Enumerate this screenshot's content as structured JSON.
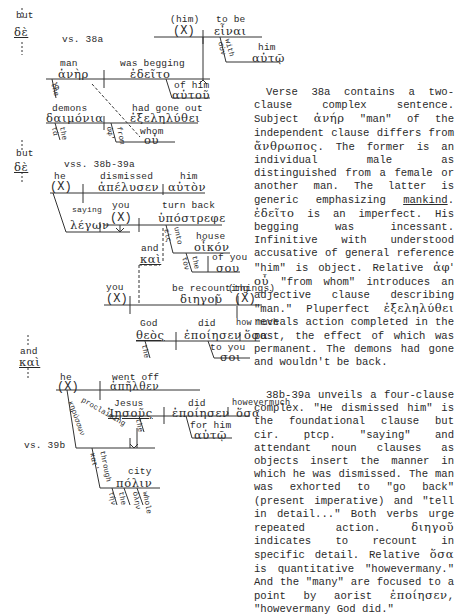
{
  "diagram": {
    "connectors": {
      "but_1": {
        "en": "but",
        "gk": "δὲ"
      },
      "but_2": {
        "en": "but",
        "gk": "δὲ"
      },
      "and_1": {
        "en": "and",
        "gk": "καὶ"
      }
    },
    "verse_labels": {
      "v38a": "vs. 38a",
      "v38b39a": "vss. 38b-39a",
      "v39b": "vs. 39b"
    },
    "clause_38a": {
      "subject": {
        "en": "man",
        "gk": "ἀνὴρ"
      },
      "verb": {
        "en": "was begging",
        "gk": "ἐδεῖτο"
      },
      "article": "the",
      "article_gk": "ὁ",
      "genitive": {
        "en": "of him",
        "gk": "αὐτοῦ"
      },
      "inf_subject": {
        "en": "(him)",
        "gk": "(X)"
      },
      "infinitive": {
        "en": "to be",
        "gk": "εἶναι"
      },
      "with": {
        "en": "with",
        "gk": "σὺν"
      },
      "with_obj": {
        "en": "him",
        "gk": "αὐτῷ"
      },
      "rel_subject": {
        "en": "demons",
        "gk": "δαιμόνια"
      },
      "rel_article": {
        "en": "the",
        "gk": "τὰ"
      },
      "rel_verb": {
        "en": "had gone out",
        "gk": "ἐξεληλύθει"
      },
      "rel_prep": {
        "en": "from",
        "gk": "ἀφ'"
      },
      "rel_obj": {
        "en": "whom",
        "gk": "οὗ"
      }
    },
    "clause_38b39a": {
      "subject": {
        "en": "he",
        "gk": "(X)"
      },
      "verb": {
        "en": "dismissed",
        "gk": "ἀπέλυσεν"
      },
      "object": {
        "en": "him",
        "gk": "αὐτὸν"
      },
      "participle": {
        "en": "saying",
        "gk": "λέγων"
      },
      "sub1_subject": {
        "en": "you",
        "gk": "(X)"
      },
      "sub1_verb": {
        "en": "turn back",
        "gk": "ὑπόστρεφε"
      },
      "sub1_prep": {
        "en": "unto",
        "gk": "εἰς"
      },
      "sub1_obj": {
        "en": "house",
        "gk": "οἶκόν"
      },
      "sub1_art": {
        "en": "the",
        "gk": "τὸν"
      },
      "sub1_gen": {
        "en": "of you",
        "gk": "σου"
      },
      "conj": {
        "en": "and",
        "gk": "καὶ"
      },
      "sub2_subject": {
        "en": "you",
        "gk": "(X)"
      },
      "sub2_verb": {
        "en": "be recounting",
        "gk": "διηγοῦ"
      },
      "sub2_obj": {
        "en": "(things)",
        "gk": "(X)"
      },
      "rel_subject": {
        "en": "God",
        "gk": "θεὸς"
      },
      "rel_art": {
        "en": "the",
        "gk": "ὁ"
      },
      "rel_verb": {
        "en": "did",
        "gk": "ἐποίησεν"
      },
      "rel_obj": {
        "en": "how much",
        "gk": "ὅσα"
      },
      "rel_io": {
        "en": "to you",
        "gk": "σοι"
      }
    },
    "clause_39b": {
      "subject": {
        "en": "he",
        "gk": "(X)"
      },
      "verb": {
        "en": "went off",
        "gk": "ἀπῆλθεν"
      },
      "participle": {
        "en": "proclaiming",
        "gk": "κηρύσσων"
      },
      "rel_subject": {
        "en": "Jesus",
        "gk": "Ἰησοῦς"
      },
      "rel_art": {
        "en": "the",
        "gk": "ὁ"
      },
      "rel_verb": {
        "en": "did",
        "gk": "ἐποίησεν"
      },
      "rel_obj": {
        "en": "howevermuch",
        "gk": "ὅσα"
      },
      "rel_io": {
        "en": "for him",
        "gk": "αὐτῷ"
      },
      "prep": {
        "en": "through",
        "gk": "κατ'"
      },
      "prep_obj": {
        "en": "city",
        "gk": "πόλιν"
      },
      "prep_art": {
        "en": "the",
        "gk": "τὴν"
      },
      "prep_adj": {
        "en": "whole",
        "gk": "ὅλην"
      }
    }
  },
  "commentary": {
    "p1": [
      "Verse 38a contains a two-clause complex sentence. Subject ",
      "ἀνήρ",
      " \"man\" of the independent clause differs from ",
      "ἄνθρωπος",
      ". The former is an individual male as distinguished from a female or another man. The latter is generic emphasizing ",
      "mankind",
      ". ",
      "ἐδεῖτο",
      " is an imperfect. His begging was incessant. Infinitive with understood accusative of general reference \"him\" is object. Relative ",
      "ἀφ' οὗ",
      " \"from whom\" introduces an adjective clause describing \"man.\" Pluperfect ",
      "ἐξεληλύθει",
      " reveals action completed in the past, the effect of which was permanent. The demons had gone and wouldn't be back."
    ],
    "p2": [
      "38b-39a unveils a four-clause complex. \"He dismissed him\" is the foundational clause but cir. ptcp. \"saying\" and attendant noun clauses as objects insert the manner in which he was dismissed. The man was exhorted to \"go back\"(present imperative) and \"tell in detail...\" Both verbs urge repeated action. ",
      "διηγοῦ",
      " indicates to recount in specific detail. Relative ",
      "ὅσα",
      " is quantitative \"howevermany.\" And the \"many\" are focused to a point by aorist ",
      "ἐποίησεν",
      ", \"howevermany God did.\""
    ]
  }
}
